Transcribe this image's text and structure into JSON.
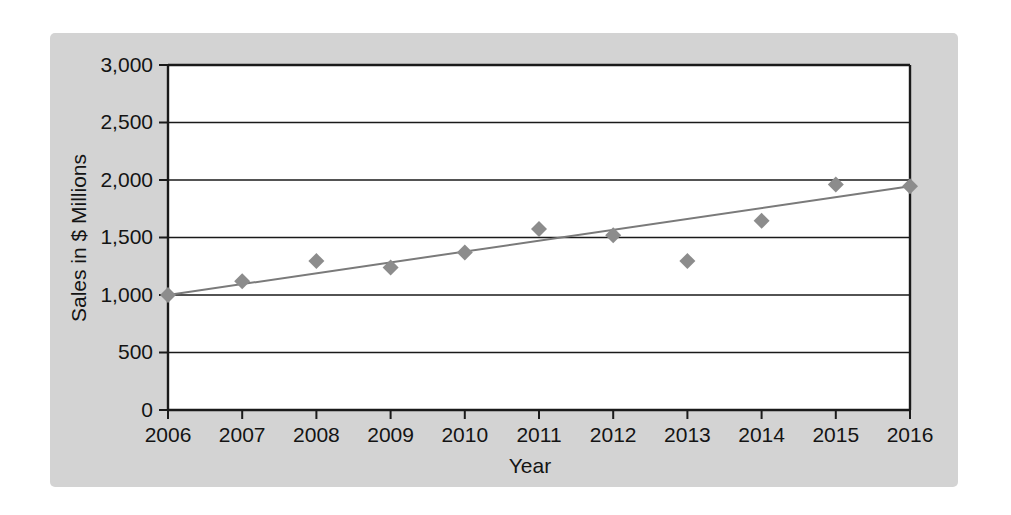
{
  "chart_data": {
    "type": "scatter",
    "title": "",
    "xlabel": "Year",
    "ylabel": "Sales in $ Millions",
    "x": [
      2006,
      2007,
      2008,
      2009,
      2010,
      2011,
      2012,
      2013,
      2014,
      2015,
      2016
    ],
    "categories": [
      "2006",
      "2007",
      "2008",
      "2009",
      "2010",
      "2011",
      "2012",
      "2013",
      "2014",
      "2015",
      "2016"
    ],
    "values": [
      1000,
      1120,
      1295,
      1240,
      1370,
      1575,
      1520,
      1295,
      1645,
      1960,
      1945
    ],
    "series": [
      {
        "name": "Sales",
        "marker": "diamond",
        "color": "#8c8c8c",
        "values": [
          1000,
          1120,
          1295,
          1240,
          1370,
          1575,
          1520,
          1295,
          1645,
          1960,
          1945
        ]
      },
      {
        "name": "Trend line",
        "type": "line",
        "color": "#7a7a7a",
        "endpoints": [
          {
            "x": 2006,
            "y": 1000
          },
          {
            "x": 2016,
            "y": 1945
          }
        ]
      }
    ],
    "xlim": [
      2006,
      2016
    ],
    "ylim": [
      0,
      3000
    ],
    "ytick_values": [
      0,
      500,
      1000,
      1500,
      2000,
      2500,
      3000
    ],
    "ytick_labels": [
      "0",
      "500",
      "1,000",
      "1,500",
      "2,000",
      "2,500",
      "3,000"
    ],
    "xtick_labels": [
      "2006",
      "2007",
      "2008",
      "2009",
      "2010",
      "2011",
      "2012",
      "2013",
      "2014",
      "2015",
      "2016"
    ],
    "grid": "horizontal",
    "legend": "none",
    "plot_background": "#ffffff",
    "panel_background": "#d3d3d3",
    "axis_color": "#1a1a1a"
  }
}
